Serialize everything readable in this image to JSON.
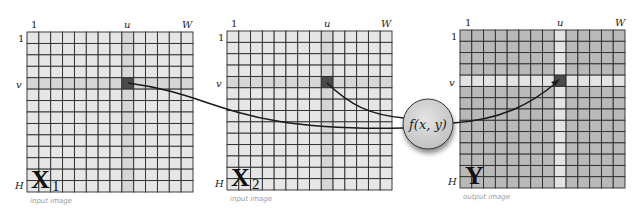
{
  "diagram": {
    "grid_cols": 14,
    "grid_rows": 14,
    "highlight_col_index": 8,
    "highlight_row_index": 4,
    "axis_labels": {
      "col_first": "1",
      "col_highlight": "u",
      "col_last": "W",
      "row_first": "1",
      "row_highlight": "v",
      "row_last": "H"
    },
    "panels": [
      {
        "id": "x1",
        "symbol": "X",
        "subscript": "1",
        "caption": "input image",
        "style": "input"
      },
      {
        "id": "x2",
        "symbol": "X",
        "subscript": "2",
        "caption": "input image",
        "style": "input"
      },
      {
        "id": "y",
        "symbol": "Y",
        "subscript": "",
        "caption": "output image",
        "style": "output"
      }
    ],
    "function_node": {
      "label": "f(x, y)"
    },
    "colors": {
      "input_cell": "#e6e6e6",
      "input_highlight": "#d6d6d6",
      "output_cell": "#b9b9b9",
      "output_highlight": "#e3e3e3",
      "selected_cell": "#4a4a4a",
      "grid_line": "#2b2b2b",
      "node_fill": "#d4d4d4",
      "curve": "#1a1a1a"
    }
  }
}
